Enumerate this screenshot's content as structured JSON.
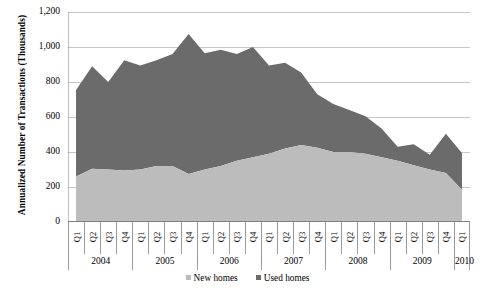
{
  "chart_data": {
    "type": "area",
    "stacked": true,
    "title": "",
    "xlabel": "",
    "ylabel": "Annualized Number of Transactions (Thousands)",
    "ylim": [
      0,
      1200
    ],
    "ytick_labels": [
      "1,200",
      "1,000",
      "800",
      "600",
      "400",
      "200",
      "0"
    ],
    "ytick_values": [
      1200,
      1000,
      800,
      600,
      400,
      200,
      0
    ],
    "grid": true,
    "grid_axis": "y",
    "legend_position": "bottom",
    "quarters": [
      "Q1",
      "Q2",
      "Q3",
      "Q4",
      "Q1",
      "Q2",
      "Q3",
      "Q4",
      "Q1",
      "Q2",
      "Q3",
      "Q4",
      "Q1",
      "Q2",
      "Q3",
      "Q4",
      "Q1",
      "Q2",
      "Q3",
      "Q4",
      "Q1",
      "Q2",
      "Q3",
      "Q4",
      "Q1"
    ],
    "years": [
      {
        "label": "2004",
        "quarters": 4
      },
      {
        "label": "2005",
        "quarters": 4
      },
      {
        "label": "2006",
        "quarters": 4
      },
      {
        "label": "2007",
        "quarters": 4
      },
      {
        "label": "2008",
        "quarters": 4
      },
      {
        "label": "2009",
        "quarters": 4
      },
      {
        "label": "2010",
        "quarters": 1
      }
    ],
    "x": [
      "2004 Q1",
      "2004 Q2",
      "2004 Q3",
      "2004 Q4",
      "2005 Q1",
      "2005 Q2",
      "2005 Q3",
      "2005 Q4",
      "2006 Q1",
      "2006 Q2",
      "2006 Q3",
      "2006 Q4",
      "2007 Q1",
      "2007 Q2",
      "2007 Q3",
      "2007 Q4",
      "2008 Q1",
      "2008 Q2",
      "2008 Q3",
      "2008 Q4",
      "2009 Q1",
      "2009 Q2",
      "2009 Q3",
      "2009 Q4",
      "2010 Q1"
    ],
    "series": [
      {
        "name": "New homes",
        "color": "#bcbcbc",
        "values": [
          260,
          305,
          300,
          295,
          300,
          320,
          320,
          275,
          300,
          320,
          350,
          370,
          390,
          420,
          440,
          425,
          400,
          400,
          390,
          370,
          350,
          325,
          300,
          280,
          185
        ]
      },
      {
        "name": "Used homes",
        "color": "#6b6b6b",
        "values": [
          495,
          585,
          500,
          630,
          595,
          605,
          640,
          800,
          665,
          665,
          610,
          630,
          505,
          490,
          415,
          305,
          275,
          240,
          215,
          165,
          80,
          120,
          85,
          225,
          210
        ]
      }
    ],
    "totals": [
      755,
      890,
      800,
      925,
      895,
      925,
      960,
      1075,
      965,
      985,
      960,
      1000,
      895,
      910,
      855,
      730,
      675,
      640,
      605,
      535,
      430,
      445,
      385,
      505,
      395
    ]
  },
  "legend": {
    "entries": [
      {
        "label": "New homes",
        "color": "#bcbcbc"
      },
      {
        "label": "Used homes",
        "color": "#6b6b6b"
      }
    ]
  }
}
